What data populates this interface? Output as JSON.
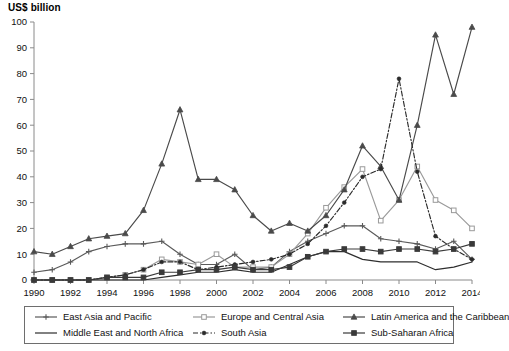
{
  "chart_data": {
    "type": "line",
    "title": "",
    "ylabel": "US$ billion",
    "xlabel": "",
    "ylim": [
      0,
      100
    ],
    "ytick_step": 10,
    "yticks": [
      0,
      10,
      20,
      30,
      40,
      50,
      60,
      70,
      80,
      90,
      100
    ],
    "x": [
      1990,
      1991,
      1992,
      1993,
      1994,
      1995,
      1996,
      1997,
      1998,
      1999,
      2000,
      2001,
      2002,
      2003,
      2004,
      2005,
      2006,
      2007,
      2008,
      2009,
      2010,
      2011,
      2012,
      2013,
      2014
    ],
    "xtick_labels": [
      "1990",
      "1992",
      "1994",
      "1996",
      "1998",
      "2000",
      "2002",
      "2004",
      "2006",
      "2008",
      "2010",
      "2012",
      "2014"
    ],
    "xticks": [
      1990,
      1992,
      1994,
      1996,
      1998,
      2000,
      2002,
      2004,
      2006,
      2008,
      2010,
      2012,
      2014
    ],
    "grid": false,
    "legend_position": "below",
    "series": [
      {
        "name": "East Asia and Pacific",
        "marker": "plus",
        "dash": "solid",
        "color": "#5a5a5a",
        "values": [
          3,
          4,
          7,
          11,
          13,
          14,
          14,
          15,
          10,
          6,
          6,
          10,
          4,
          5,
          11,
          15,
          18,
          21,
          21,
          16,
          15,
          14,
          12,
          15,
          8
        ]
      },
      {
        "name": "Europe and Central Asia",
        "marker": "square",
        "dash": "solid",
        "color": "#9a9a9a",
        "values": [
          0,
          0,
          0,
          0,
          1,
          2,
          4,
          8,
          7,
          6,
          10,
          5,
          5,
          5,
          10,
          18,
          28,
          36,
          43,
          23,
          31,
          44,
          31,
          27,
          20
        ]
      },
      {
        "name": "Latin America and the Caribbean",
        "marker": "triangle",
        "dash": "solid",
        "color": "#4a4a4a",
        "values": [
          11,
          10,
          13,
          16,
          17,
          18,
          27,
          45,
          66,
          39,
          39,
          35,
          25,
          19,
          22,
          19,
          25,
          35,
          52,
          44,
          31,
          60,
          95,
          72,
          98
        ]
      },
      {
        "name": "Middle East and North Africa",
        "marker": "none",
        "dash": "solid",
        "color": "#2e2e2e",
        "values": [
          0,
          0,
          0,
          0,
          0,
          0,
          0,
          1,
          2,
          3,
          3,
          4,
          3,
          3,
          6,
          9,
          11,
          11,
          8,
          7,
          7,
          7,
          4,
          5,
          7
        ]
      },
      {
        "name": "South Asia",
        "marker": "dot",
        "dash": "dashdot",
        "color": "#2b2b2b",
        "values": [
          0,
          0,
          0,
          0,
          1,
          2,
          4,
          7,
          7,
          4,
          5,
          6,
          7,
          8,
          10,
          14,
          21,
          30,
          40,
          43,
          78,
          42,
          17,
          12,
          8
        ]
      },
      {
        "name": "Sub-Saharan Africa",
        "marker": "square-filled",
        "dash": "solid",
        "color": "#3a3a3a",
        "values": [
          0,
          0,
          0,
          0,
          1,
          1,
          1,
          3,
          3,
          4,
          4,
          5,
          4,
          4,
          5,
          9,
          11,
          12,
          12,
          11,
          12,
          12,
          11,
          12,
          14
        ]
      }
    ]
  },
  "legend": {
    "items": [
      {
        "label": "East Asia and Pacific"
      },
      {
        "label": "Europe and Central Asia"
      },
      {
        "label": "Latin America and the Caribbean"
      },
      {
        "label": "Middle East and North Africa"
      },
      {
        "label": "South Asia"
      },
      {
        "label": "Sub-Saharan Africa"
      }
    ]
  }
}
